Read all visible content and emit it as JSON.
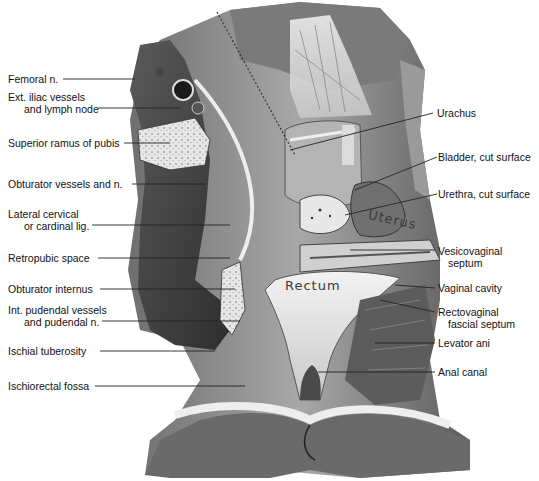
{
  "figure": {
    "type": "anatomical illustration",
    "embedded_labels": {
      "uterus": "Uterus",
      "rectum": "Rectum"
    },
    "colors": {
      "background": "#ffffff",
      "text": "#111111",
      "leader_line": "#222222",
      "tissue_dark": "#4a4a4a",
      "tissue_mid": "#8c8c8c",
      "tissue_light": "#d8d8d8"
    }
  },
  "labels_left": [
    {
      "line1": "Femoral n.",
      "line2": ""
    },
    {
      "line1": "Ext. iliac vessels",
      "line2": "and lymph node"
    },
    {
      "line1": "Superior ramus of pubis",
      "line2": ""
    },
    {
      "line1": "Obturator vessels and n.",
      "line2": ""
    },
    {
      "line1": "Lateral cervical",
      "line2": "or cardinal lig."
    },
    {
      "line1": "Retropubic space",
      "line2": ""
    },
    {
      "line1": "Obturator internus",
      "line2": ""
    },
    {
      "line1": "Int. pudendal vessels",
      "line2": "and pudendal n."
    },
    {
      "line1": "Ischial tuberosity",
      "line2": ""
    },
    {
      "line1": "Ischiorectal fossa",
      "line2": ""
    }
  ],
  "labels_right": [
    {
      "line1": "Urachus",
      "line2": ""
    },
    {
      "line1": "Bladder, cut surface",
      "line2": ""
    },
    {
      "line1": "Urethra, cut surface",
      "line2": ""
    },
    {
      "line1": "Vesicovaginal",
      "line2": "septum"
    },
    {
      "line1": "Vaginal cavity",
      "line2": ""
    },
    {
      "line1": "Rectovaginal",
      "line2": "fascial septum"
    },
    {
      "line1": "Levator ani",
      "line2": ""
    },
    {
      "line1": "Anal canal",
      "line2": ""
    }
  ]
}
